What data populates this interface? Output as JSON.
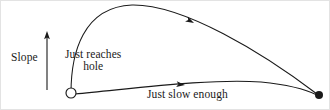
{
  "figure": {
    "background_color": "#ffffff",
    "stroke_color": "#1a1a1a",
    "width": 330,
    "height": 110
  },
  "axis": {
    "slope_label": "Slope",
    "arrow_direction": "up",
    "arrow_x": 46,
    "arrow_top_y": 31,
    "arrow_bottom_y": 89
  },
  "labels": {
    "upper_line1": "Just reaches",
    "upper_line2": "hole",
    "lower": "Just slow enough"
  },
  "markers": {
    "start": {
      "name": "open-circle",
      "x": 70,
      "y": 92,
      "r": 5,
      "filled": false
    },
    "end": {
      "name": "filled-dot",
      "x": 318,
      "y": 94,
      "r": 4,
      "filled": true
    }
  },
  "chart_data": {
    "type": "line",
    "xlabel": "",
    "ylabel": "Slope",
    "grid": false,
    "legend": "inline-annotations",
    "series": [
      {
        "name": "Just reaches hole",
        "label_position": {
          "x": 64,
          "y": 47
        },
        "arrow_marker": {
          "x": 193,
          "y": 22,
          "direction": "left"
        },
        "path": "M 70 92 C 70 52, 82 6, 131 4 C 182 3, 262 52, 316 93",
        "points": [
          {
            "x": 70,
            "y": 92
          },
          {
            "x": 78,
            "y": 50
          },
          {
            "x": 100,
            "y": 16
          },
          {
            "x": 131,
            "y": 4
          },
          {
            "x": 170,
            "y": 12
          },
          {
            "x": 215,
            "y": 34
          },
          {
            "x": 265,
            "y": 62
          },
          {
            "x": 316,
            "y": 93
          }
        ]
      },
      {
        "name": "Just slow enough",
        "label_position": {
          "x": 146,
          "y": 87
        },
        "arrow_marker": {
          "x": 184,
          "y": 84,
          "direction": "left"
        },
        "path": "M 74 93 C 130 88, 210 77, 260 81 C 290 84, 306 89, 316 94",
        "points": [
          {
            "x": 74,
            "y": 93
          },
          {
            "x": 120,
            "y": 87
          },
          {
            "x": 170,
            "y": 82
          },
          {
            "x": 222,
            "y": 79
          },
          {
            "x": 265,
            "y": 82
          },
          {
            "x": 316,
            "y": 94
          }
        ]
      }
    ]
  }
}
